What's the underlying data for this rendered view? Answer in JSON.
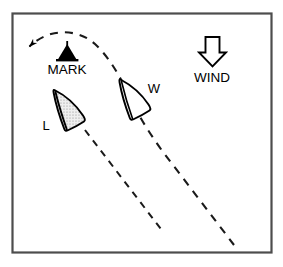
{
  "diagram": {
    "frame": {
      "stroke": "#4d4d4d",
      "fill": "#ffffff",
      "x": 12,
      "y": 13,
      "width": 260,
      "height": 240
    },
    "labels": {
      "mark": "MARK",
      "wind": "WIND",
      "leeward_boat": "L",
      "windward_boat": "W"
    },
    "mark": {
      "name": "racing-mark-buoy",
      "color": "#000000",
      "x": 67,
      "y": 56
    },
    "wind_arrow": {
      "name": "wind-direction-arrow",
      "direction": "down",
      "stroke": "#000000",
      "fill": "#ffffff",
      "x": 212,
      "y": 50
    },
    "boats": [
      {
        "id": "L",
        "label": "L",
        "role": "leeward",
        "fill": "#e3e3e3",
        "stroke": "#000000",
        "shaded": true,
        "x": 71,
        "y": 110,
        "heading_deg": 300
      },
      {
        "id": "W",
        "label": "W",
        "role": "windward",
        "fill": "#ffffff",
        "stroke": "#000000",
        "shaded": false,
        "x": 138,
        "y": 102,
        "heading_deg": 300
      }
    ],
    "paths": [
      {
        "name": "leeward-track",
        "style": "dashed",
        "stroke": "#1a1a1a",
        "from": [
          86,
          131
        ],
        "to": [
          163,
          232
        ]
      },
      {
        "name": "windward-track-with-rounding-arc",
        "style": "dashed",
        "stroke": "#1a1a1a",
        "from": [
          234,
          245
        ],
        "to": [
          29,
          47
        ],
        "has_arrowhead": true,
        "arrowhead_at": [
          29,
          47
        ]
      }
    ]
  }
}
